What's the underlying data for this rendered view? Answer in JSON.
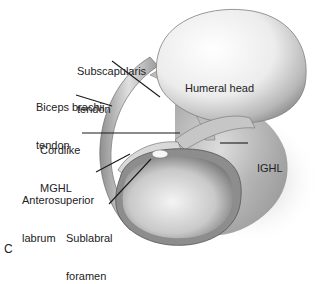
{
  "figure": {
    "panel_letter": "C",
    "labels": {
      "subscapularis_line1": "Subscapularis",
      "subscapularis_line2": "tendon",
      "humeral_head": "Humeral head",
      "biceps_line1": "Biceps brachii",
      "biceps_line2": "tendon",
      "cordlike_line1": "Cordlike",
      "cordlike_line2": "MGHL",
      "ighl": "IGHL",
      "anterosuperior_line1": "Anterosuperior",
      "anterosuperior_line2": "labrum",
      "sublabral_line1": "Sublabral",
      "sublabral_line2": "foramen"
    },
    "colors": {
      "background": "#ffffff",
      "text": "#222222",
      "leader_line": "#1a1a1a",
      "bone_light": "#f2f2f2",
      "bone_shadow": "#8a8a8a",
      "tendon": "#b5b5b5"
    }
  }
}
